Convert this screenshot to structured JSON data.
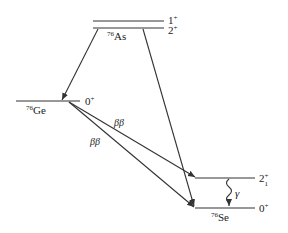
{
  "diagram": {
    "nuclei": {
      "as": {
        "mass": "76",
        "symbol": "As",
        "levels": [
          {
            "spin": "1",
            "parity": "+"
          },
          {
            "spin": "2",
            "parity": "+"
          }
        ]
      },
      "ge": {
        "mass": "76",
        "symbol": "Ge",
        "levels": [
          {
            "spin": "0",
            "parity": "+"
          }
        ]
      },
      "se": {
        "mass": "76",
        "symbol": "Se",
        "levels": [
          {
            "spin": "2",
            "parity": "+",
            "sub": "1"
          },
          {
            "spin": "0",
            "parity": "+"
          }
        ]
      }
    },
    "transitions": [
      {
        "from": "76As 2+",
        "to": "76Ge 0+",
        "label": ""
      },
      {
        "from": "76As 2+",
        "to": "76Se 0+",
        "label": ""
      },
      {
        "from": "76Ge 0+",
        "to": "76Se 2+1",
        "label": "ββ"
      },
      {
        "from": "76Ge 0+",
        "to": "76Se 0+",
        "label": "ββ"
      },
      {
        "from": "76Se 2+1",
        "to": "76Se 0+",
        "label": "γ"
      }
    ],
    "colors": {
      "line": "#333333",
      "text": "#222222"
    }
  }
}
